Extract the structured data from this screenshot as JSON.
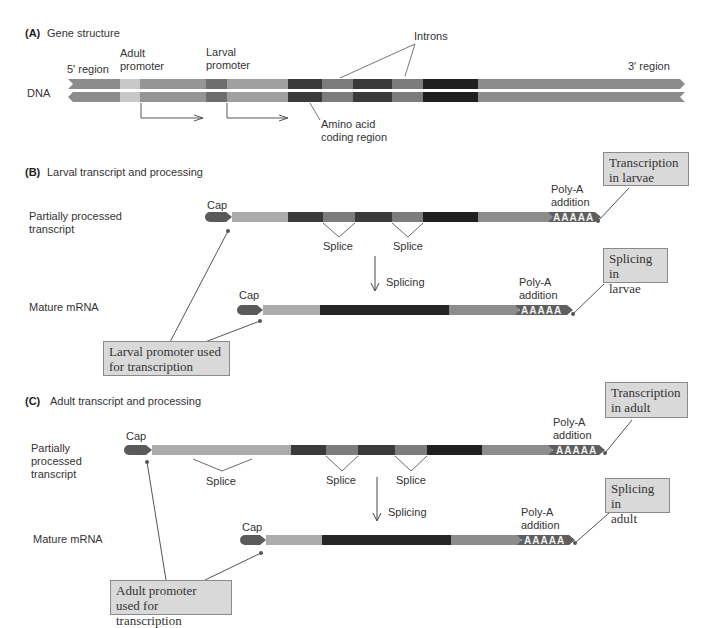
{
  "colors": {
    "flank": "#8c8c8c",
    "adult_promoter": "#c8c8c8",
    "larval_promoter": "#6e6e6e",
    "leader": "#a8a8a8",
    "exon1": "#3a3a3a",
    "exon2": "#3a3a3a",
    "exon3": "#1f1f1f",
    "intron": "#7c7c7c",
    "cap": "#5a5a5a",
    "polyA": "#5e5e5e",
    "callout_bg": "#d9d9d9",
    "line": "#555555"
  },
  "panelA": {
    "tag": "(A)",
    "title": "Gene structure",
    "five_prime": "5′ region",
    "three_prime": "3′ region",
    "dna_label": "DNA",
    "adult_promoter": [
      "Adult",
      "promoter"
    ],
    "larval_promoter": [
      "Larval",
      "promoter"
    ],
    "introns": "Introns",
    "coding": [
      "Amino acid",
      "coding region"
    ]
  },
  "panelB": {
    "tag": "(B)",
    "title": "Larval transcript and processing",
    "row1_label": [
      "Partially processed",
      "transcript"
    ],
    "row2_label": "Mature mRNA",
    "cap1": "Cap",
    "cap2": "Cap",
    "splice1": "Splice",
    "splice2": "Splice",
    "splicing": "Splicing",
    "polyA_label": [
      "Poly-A",
      "addition"
    ],
    "polyA_tail": "AAAAA",
    "callout_transcription": [
      "Transcription",
      "in larvae"
    ],
    "callout_splicing": [
      "Splicing in",
      "larvae"
    ],
    "callout_promoter": [
      "Larval promoter used",
      "for transcription"
    ]
  },
  "panelC": {
    "tag": "(C)",
    "title": "Adult transcript and processing",
    "row1_label": [
      "Partially",
      "processed",
      "transcript"
    ],
    "row2_label": "Mature mRNA",
    "cap1": "Cap",
    "cap2": "Cap",
    "splice0": "Splice",
    "splice1": "Splice",
    "splice2": "Splice",
    "splicing": "Splicing",
    "polyA_label": [
      "Poly-A",
      "addition"
    ],
    "polyA_tail": "AAAAA",
    "callout_transcription": [
      "Transcription",
      "in adult"
    ],
    "callout_splicing": [
      "Splicing in",
      "adult"
    ],
    "callout_promoter": [
      "Adult promoter",
      "used for transcription"
    ]
  }
}
